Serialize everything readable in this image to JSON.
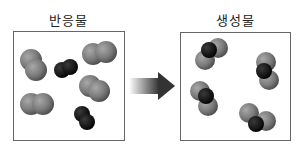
{
  "left_panel": {
    "title": "반응물"
  },
  "right_panel": {
    "title": "생성물"
  },
  "arrow": {
    "direction": "right",
    "meaning": "reaction"
  },
  "colors": {
    "gray_atom": "#7a7a7a",
    "black_atom": "#1a1a1a",
    "border": "#666666"
  },
  "reactants": [
    {
      "type": "gray-diatomic",
      "count": 4
    },
    {
      "type": "black-diatomic",
      "count": 2
    }
  ],
  "products": [
    {
      "type": "gray-black-gray-triatomic",
      "count": 4
    }
  ]
}
